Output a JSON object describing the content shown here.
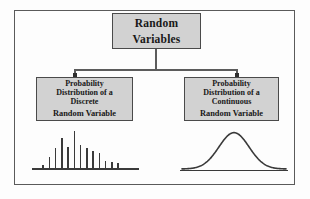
{
  "diagram": {
    "frame": {
      "border_color": "#5a5a5a",
      "background": "#fdfdfd"
    },
    "box_style": {
      "fill": "#d2d2d2",
      "border": "#4a4a4a",
      "text_color": "#181818"
    },
    "nodes": {
      "root": {
        "name": "random-variables",
        "lines": [
          "Random",
          "Variables"
        ]
      },
      "discrete": {
        "name": "discrete-random-variable",
        "lines": [
          "Probability",
          "Distribution of a",
          "Discrete"
        ],
        "emphasis_line": "Random Variable"
      },
      "continuous": {
        "name": "continuous-random-variable",
        "lines": [
          "Probability",
          "Distribution of a",
          "Continuous"
        ],
        "emphasis_line": "Random Variable"
      }
    },
    "connectors": {
      "style": "elbow",
      "line_color": "#5c5c5c",
      "arrowhead_color": "#2e2e2e",
      "from": "root",
      "to": [
        "discrete",
        "continuous"
      ]
    }
  },
  "chart_data": [
    {
      "name": "discrete-distribution-plot",
      "type": "bar",
      "title": "",
      "xlabel": "",
      "ylabel": "",
      "categories": [
        "1",
        "2",
        "3",
        "4",
        "5",
        "6",
        "7",
        "8",
        "9",
        "10",
        "11",
        "12",
        "13"
      ],
      "values": [
        4,
        11,
        19,
        28,
        20,
        34,
        22,
        19,
        16,
        14,
        7,
        6,
        5
      ],
      "ylim": [
        0,
        36
      ],
      "grid": false,
      "legend": "none",
      "bar_color": "#3a3a3a",
      "axis_color": "#3a3a3a",
      "baseline": true
    },
    {
      "name": "continuous-distribution-plot",
      "type": "line",
      "title": "",
      "xlabel": "",
      "ylabel": "",
      "description": "symmetric bell-shaped normal density curve on a baseline",
      "x": [
        0,
        0.08,
        0.16,
        0.24,
        0.32,
        0.4,
        0.5,
        0.6,
        0.68,
        0.76,
        0.84,
        0.92,
        1.0
      ],
      "y": [
        0.02,
        0.04,
        0.09,
        0.22,
        0.48,
        0.8,
        1.0,
        0.8,
        0.48,
        0.22,
        0.09,
        0.04,
        0.02
      ],
      "ylim": [
        0,
        1.1
      ],
      "grid": false,
      "legend": "none",
      "line_color": "#3a3a3a",
      "axis_color": "#3a3a3a",
      "baseline": true
    }
  ]
}
